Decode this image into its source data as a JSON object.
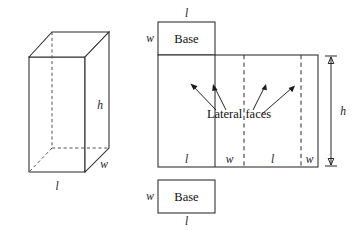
{
  "figure": {
    "background_color": "#ffffff",
    "line_color": "#2a2a2a",
    "hidden_line_color": "#555555",
    "text_color": "#1a1a1a"
  },
  "prism": {
    "caption": "rectangular prism",
    "labels": {
      "height": "h",
      "length": "l",
      "width": "w"
    }
  },
  "net": {
    "caption": "unfolded net",
    "top_base": {
      "label": "Base",
      "top_edge_label": "l",
      "left_edge_label": "w"
    },
    "bottom_base": {
      "label": "Base",
      "bottom_edge_label": "l",
      "left_edge_label": "w"
    },
    "lateral": {
      "callout_label": "Lateral faces",
      "height_label": "h",
      "panel_labels": [
        "l",
        "w",
        "l",
        "w"
      ],
      "arrow_count": 4
    }
  }
}
